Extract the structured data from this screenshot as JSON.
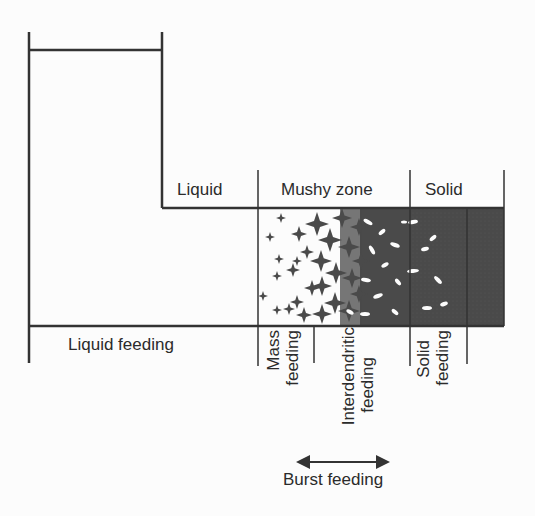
{
  "diagram": {
    "zones": [
      {
        "id": "liquid",
        "label": "Liquid"
      },
      {
        "id": "mushy",
        "label": "Mushy zone"
      },
      {
        "id": "solid",
        "label": "Solid"
      }
    ],
    "feeding_mechanisms": [
      {
        "id": "liquid-feeding",
        "label": "Liquid feeding"
      },
      {
        "id": "mass-feeding",
        "line1": "Mass",
        "line2": "feeding"
      },
      {
        "id": "interdendritic-feeding",
        "line1": "Interdendritic",
        "line2": "feeding"
      },
      {
        "id": "solid-feeding",
        "line1": "Solid",
        "line2": "feeding"
      },
      {
        "id": "burst-feeding",
        "label": "Burst feeding"
      }
    ],
    "colors": {
      "line": "#333333",
      "solid_fill": "#4a4a4a",
      "crystal_fill": "#4a4a4a",
      "background": "#fcfcfc"
    }
  }
}
